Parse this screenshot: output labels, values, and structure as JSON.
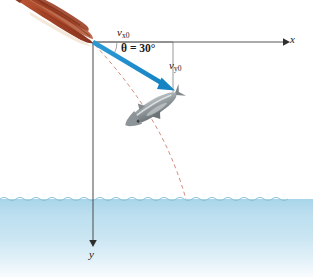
{
  "figure": {
    "background_color": "#ffffff"
  },
  "axes": {
    "x_axis": {
      "label": "x",
      "name": "x-axis",
      "color": "#6e6e6e",
      "origin": [
        93,
        42
      ],
      "end": [
        288,
        42
      ]
    },
    "y_axis": {
      "label": "y",
      "name": "y-axis",
      "color": "#6e6e6e",
      "origin": [
        93,
        42
      ],
      "end": [
        93,
        246
      ]
    }
  },
  "annotations": {
    "vx0": {
      "symbol": "v",
      "subscript": "x0",
      "full": "vx0",
      "color": "#1a1a1a"
    },
    "vy0": {
      "symbol": "v",
      "subscript": "y0",
      "full": "vy0",
      "color": "#1a1a1a"
    },
    "angle": {
      "text": "θ = 30°",
      "value": 30,
      "unit": "degrees",
      "color": "#1a1a1a"
    }
  },
  "vectors": {
    "velocity": {
      "name": "initial-velocity-vector",
      "color": "#1e8ecb",
      "start": [
        93,
        42
      ],
      "end": [
        173,
        90
      ],
      "angle_below_horizontal": 30
    },
    "component_lines": {
      "color": "#8c8c8c",
      "horizontal": {
        "from": [
          93,
          42
        ],
        "to": [
          173,
          42
        ]
      },
      "vertical": {
        "from": [
          173,
          42
        ],
        "to": [
          173,
          92
        ]
      }
    }
  },
  "trajectory": {
    "name": "parabolic-trajectory",
    "style": "dashed",
    "color": "#d4907f",
    "start": [
      95,
      45
    ],
    "water_entry": [
      186,
      199
    ]
  },
  "objects": {
    "squid": {
      "name": "squid",
      "color_body": "#a8432a",
      "color_highlight": "#d4714a",
      "color_fin": "#f0e2d0",
      "position": "upper-left"
    },
    "fish": {
      "name": "fish",
      "color_body": "#9ea4a6",
      "color_dark": "#6d7477",
      "color_light": "#d6dadb",
      "position": "mid-trajectory"
    }
  },
  "water": {
    "name": "water-region",
    "surface_y": 199,
    "color_top": "#a9d6ea",
    "color_mid": "#c3e2f1",
    "color_bottom": "#f4fafd",
    "wave_color": "#8fc4dd"
  }
}
